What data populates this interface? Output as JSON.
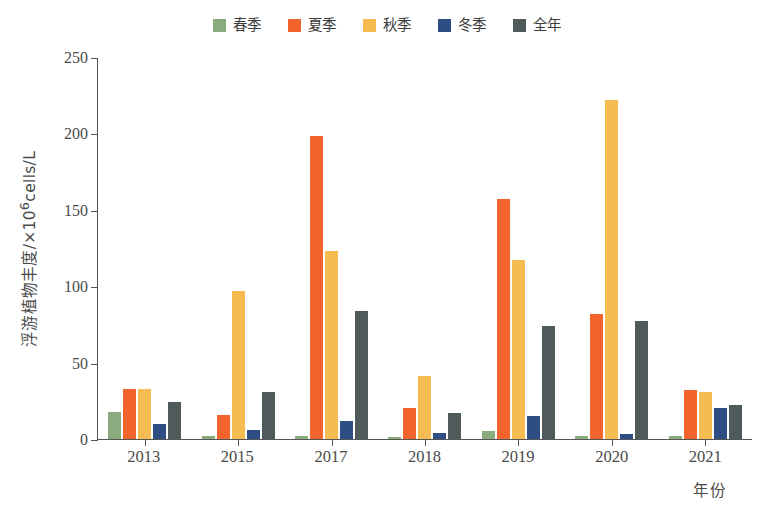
{
  "chart_data": {
    "type": "bar",
    "title": "",
    "xlabel": "年份",
    "ylabel": "浮游植物丰度/×10⁶cells/L",
    "ylabel_parts": {
      "pre": "浮游植物丰度/×10",
      "sup": "6",
      "post": "cells/L"
    },
    "categories": [
      "2013",
      "2015",
      "2017",
      "2018",
      "2019",
      "2020",
      "2021"
    ],
    "ylim": [
      0,
      250
    ],
    "yticks": [
      0,
      50,
      100,
      150,
      200,
      250
    ],
    "grid": false,
    "legend_position": "top-center",
    "series": [
      {
        "name": "春季",
        "color": "#8aab7e",
        "values": [
          18,
          2,
          2,
          1.5,
          5,
          2,
          2
        ]
      },
      {
        "name": "夏季",
        "color": "#f3632c",
        "values": [
          33,
          16,
          198,
          20,
          157,
          82,
          32
        ]
      },
      {
        "name": "秋季",
        "color": "#f5bc52",
        "values": [
          33,
          97,
          123,
          41,
          117,
          222,
          31
        ]
      },
      {
        "name": "冬季",
        "color": "#2e4d82",
        "values": [
          10,
          6,
          12,
          4,
          15,
          3,
          20
        ]
      },
      {
        "name": "全年",
        "color": "#4f5a5a",
        "values": [
          24,
          31,
          84,
          17,
          74,
          77,
          22
        ]
      }
    ]
  },
  "legend": {
    "items": [
      {
        "label": "春季",
        "color": "#8aab7e"
      },
      {
        "label": "夏季",
        "color": "#f3632c"
      },
      {
        "label": "秋季",
        "color": "#f5bc52"
      },
      {
        "label": "冬季",
        "color": "#2e4d82"
      },
      {
        "label": "全年",
        "color": "#4f5a5a"
      }
    ]
  },
  "axis": {
    "y_title": "浮游植物丰度/×10⁶cells/L",
    "x_title": "年份",
    "y_ticks": [
      "0",
      "50",
      "100",
      "150",
      "200",
      "250"
    ],
    "x_ticks": [
      "2013",
      "2015",
      "2017",
      "2018",
      "2019",
      "2020",
      "2021"
    ]
  }
}
